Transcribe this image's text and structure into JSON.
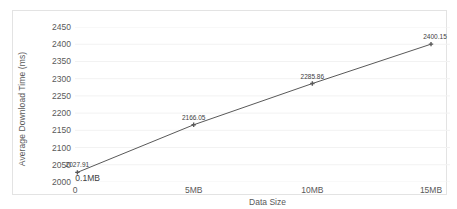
{
  "chart_data": {
    "type": "line",
    "title": "",
    "xlabel": "Data Size",
    "ylabel": "Average Download Time (ms)",
    "x": [
      0.1,
      5,
      10,
      15
    ],
    "values": [
      2027.91,
      2166.05,
      2285.86,
      2400.15
    ],
    "point_labels": [
      "2027.91",
      "2166.05",
      "2285.86",
      "2400.15"
    ],
    "x_tick_labels": [
      "0",
      "5MB",
      "10MB",
      "15MB"
    ],
    "x_tick_values": [
      0,
      5,
      10,
      15
    ],
    "y_tick_labels": [
      "2000",
      "2050",
      "2100",
      "2150",
      "2200",
      "2250",
      "2300",
      "2350",
      "2400",
      "2450"
    ],
    "y_tick_values": [
      2000,
      2050,
      2100,
      2150,
      2200,
      2250,
      2300,
      2350,
      2400,
      2450
    ],
    "xlim": [
      0,
      15.8
    ],
    "ylim": [
      2000,
      2450
    ],
    "grid": "horizontal",
    "legend": "none",
    "annotations": [
      {
        "text": "0.1MB",
        "x": 0.1,
        "note": "first data point data-size callout above x-axis"
      }
    ],
    "series_color": "#595959",
    "gridline_color": "#f2f2f2",
    "border_color": "#e3e3e3"
  }
}
